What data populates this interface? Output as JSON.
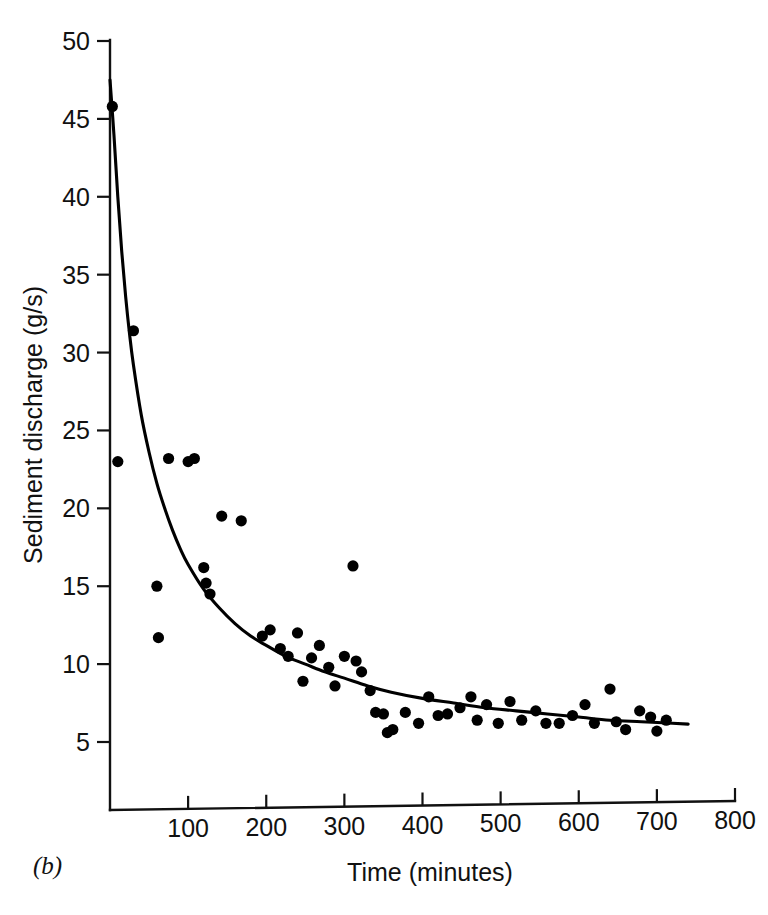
{
  "figure": {
    "panel_label": "(b)",
    "background_color": "#ffffff",
    "ink_color": "#000000"
  },
  "chart_data": {
    "type": "scatter",
    "title": "",
    "subtitle": "",
    "xlabel": "Time (minutes)",
    "ylabel": "Sediment discharge (g/s)",
    "xlim": [
      0,
      800
    ],
    "ylim": [
      0,
      50
    ],
    "x_ticks": [
      100,
      200,
      300,
      400,
      500,
      600,
      700,
      800
    ],
    "y_ticks": [
      5,
      10,
      15,
      20,
      25,
      30,
      35,
      40,
      45,
      50
    ],
    "x_tick_labels": [
      "100",
      "200",
      "300",
      "400",
      "500",
      "600",
      "700",
      "800"
    ],
    "y_tick_labels": [
      "5",
      "10",
      "15",
      "20",
      "25",
      "30",
      "35",
      "40",
      "45",
      "50"
    ],
    "grid": false,
    "legend": "none",
    "marker": "filled-circle",
    "marker_color": "#000000",
    "series": [
      {
        "name": "Measured sediment discharge",
        "type": "scatter",
        "points": [
          [
            3,
            45.8
          ],
          [
            10,
            23.0
          ],
          [
            30,
            31.4
          ],
          [
            60,
            15.0
          ],
          [
            62,
            11.7
          ],
          [
            75,
            23.2
          ],
          [
            100,
            23.0
          ],
          [
            108,
            23.2
          ],
          [
            120,
            16.2
          ],
          [
            123,
            15.2
          ],
          [
            128,
            14.5
          ],
          [
            143,
            19.5
          ],
          [
            168,
            19.2
          ],
          [
            195,
            11.8
          ],
          [
            205,
            12.2
          ],
          [
            218,
            11.0
          ],
          [
            228,
            10.5
          ],
          [
            240,
            12.0
          ],
          [
            247,
            8.9
          ],
          [
            258,
            10.4
          ],
          [
            268,
            11.2
          ],
          [
            280,
            9.8
          ],
          [
            288,
            8.6
          ],
          [
            300,
            10.5
          ],
          [
            311,
            16.3
          ],
          [
            315,
            10.2
          ],
          [
            322,
            9.5
          ],
          [
            333,
            8.3
          ],
          [
            340,
            6.9
          ],
          [
            350,
            6.8
          ],
          [
            355,
            5.6
          ],
          [
            362,
            5.8
          ],
          [
            378,
            6.9
          ],
          [
            395,
            6.2
          ],
          [
            408,
            7.9
          ],
          [
            420,
            6.7
          ],
          [
            432,
            6.8
          ],
          [
            448,
            7.2
          ],
          [
            462,
            7.9
          ],
          [
            470,
            6.4
          ],
          [
            482,
            7.4
          ],
          [
            497,
            6.2
          ],
          [
            512,
            7.6
          ],
          [
            527,
            6.4
          ],
          [
            545,
            7.0
          ],
          [
            558,
            6.2
          ],
          [
            575,
            6.2
          ],
          [
            592,
            6.7
          ],
          [
            608,
            7.4
          ],
          [
            620,
            6.2
          ],
          [
            640,
            8.4
          ],
          [
            648,
            6.3
          ],
          [
            660,
            5.8
          ],
          [
            678,
            7.0
          ],
          [
            692,
            6.6
          ],
          [
            700,
            5.7
          ],
          [
            712,
            6.4
          ]
        ]
      },
      {
        "name": "Fitted decay curve",
        "type": "line",
        "points": [
          [
            0,
            47.5
          ],
          [
            5,
            44.0
          ],
          [
            10,
            40.0
          ],
          [
            15,
            36.5
          ],
          [
            20,
            33.6
          ],
          [
            25,
            31.2
          ],
          [
            30,
            29.2
          ],
          [
            40,
            26.0
          ],
          [
            50,
            23.6
          ],
          [
            60,
            21.6
          ],
          [
            70,
            20.0
          ],
          [
            80,
            18.6
          ],
          [
            90,
            17.4
          ],
          [
            100,
            16.4
          ],
          [
            120,
            14.8
          ],
          [
            140,
            13.6
          ],
          [
            160,
            12.6
          ],
          [
            180,
            11.8
          ],
          [
            200,
            11.2
          ],
          [
            225,
            10.5
          ],
          [
            250,
            10.0
          ],
          [
            275,
            9.5
          ],
          [
            300,
            9.1
          ],
          [
            330,
            8.6
          ],
          [
            360,
            8.2
          ],
          [
            400,
            7.8
          ],
          [
            440,
            7.5
          ],
          [
            480,
            7.2
          ],
          [
            520,
            7.0
          ],
          [
            560,
            6.8
          ],
          [
            600,
            6.6
          ],
          [
            640,
            6.4
          ],
          [
            680,
            6.3
          ],
          [
            720,
            6.2
          ],
          [
            740,
            6.15
          ]
        ]
      }
    ]
  }
}
